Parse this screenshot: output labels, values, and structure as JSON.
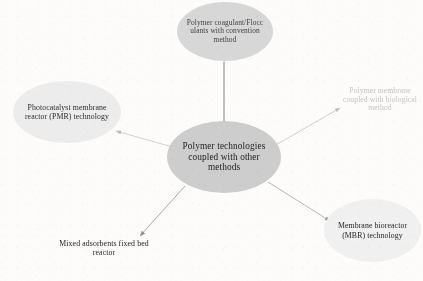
{
  "diagram": {
    "title": "Polymer technologies coupled with other methods",
    "background_color": "#fdfcfa",
    "center": {
      "id": "center",
      "label": "Polymer technologies coupled with other methods",
      "shape": "ellipse",
      "fill": "#cdcdcd",
      "text_color": "#1d1d1d"
    },
    "nodes": [
      {
        "id": "top",
        "label": "Polymer coagulant/Flocc ulants with convention method",
        "position": "top",
        "shape": "ellipse",
        "fill": "#d7d7d7",
        "text_color": "#3d3d3d"
      },
      {
        "id": "pmr",
        "label": "Photocatalyst membrane reactor (PMR) technology",
        "position": "left",
        "shape": "ellipse",
        "fill": "#ececec",
        "text_color": "#2b2b2b"
      },
      {
        "id": "bio",
        "label": "Polymer membrane coupled with biological method",
        "position": "right",
        "shape": "none",
        "fill": "none",
        "text_color": "#c3c3c3"
      },
      {
        "id": "mbr",
        "label": "Membrane bioreactor (MBR) technology",
        "position": "bottom-right",
        "shape": "ellipse",
        "fill": "#f0f0f0",
        "text_color": "#242424"
      },
      {
        "id": "adsorb",
        "label": "Mixed adsorbents fixed bed reactor",
        "position": "bottom-left",
        "shape": "none",
        "fill": "none",
        "text_color": "#242424"
      }
    ],
    "connectors": [
      {
        "id": "center-to-top",
        "from": "center",
        "to": "top",
        "arrow": false,
        "color": "#8e8e8e"
      },
      {
        "id": "center-to-pmr",
        "from": "center",
        "to": "pmr",
        "arrow": true,
        "color": "#cfcfcf"
      },
      {
        "id": "center-to-bio",
        "from": "center",
        "to": "bio",
        "arrow": true,
        "color": "#c8c8c8"
      },
      {
        "id": "center-to-mbr",
        "from": "center",
        "to": "mbr",
        "arrow": true,
        "color": "#b5b5b5"
      },
      {
        "id": "center-to-adsorb",
        "from": "center",
        "to": "adsorb",
        "arrow": true,
        "color": "#a9a9a9"
      }
    ]
  }
}
